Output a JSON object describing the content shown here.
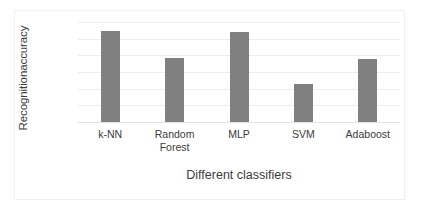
{
  "chart_data": {
    "type": "bar",
    "title": "",
    "xlabel": "Different classifiers",
    "ylabel": "Recognitionaccuracy",
    "categories": [
      "k-NN",
      "Random Forest",
      "MLP",
      "SVM",
      "Adaboost"
    ],
    "category_lines": [
      [
        "k-NN"
      ],
      [
        "Random",
        "Forest"
      ],
      [
        "MLP"
      ],
      [
        "SVM"
      ],
      [
        "Adaboost"
      ]
    ],
    "values": [
      90.9,
      87.7,
      90.8,
      84.6,
      87.6
    ],
    "ylim": [
      80,
      92
    ],
    "yticks": [
      80,
      82,
      84,
      86,
      88,
      90,
      92
    ],
    "ytick_labels": [
      "80",
      "82",
      "84",
      "86",
      "88",
      "90",
      "92"
    ],
    "grid": true,
    "legend": "none",
    "bar_color": "#808080",
    "gridline_color": "#ededed",
    "axis_text_color": "#3c3c3c",
    "background_color": "#ffffff"
  }
}
